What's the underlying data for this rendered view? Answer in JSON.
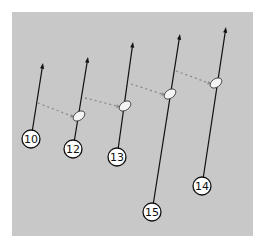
{
  "diagram": {
    "background": "#c8c8c8",
    "line_color": "#111111",
    "dash_color": "#8a8a8a",
    "nodes": [
      {
        "label": "10",
        "circle": [
          31,
          139
        ],
        "tip": [
          43,
          63
        ],
        "ellipse": null
      },
      {
        "label": "12",
        "circle": [
          73,
          149
        ],
        "tip": [
          88,
          57
        ],
        "ellipse": [
          79,
          116
        ]
      },
      {
        "label": "13",
        "circle": [
          117,
          157
        ],
        "tip": [
          133,
          42
        ],
        "ellipse": [
          125,
          106
        ]
      },
      {
        "label": "15",
        "circle": [
          152,
          212
        ],
        "tip": [
          180,
          34
        ],
        "ellipse": [
          170,
          94
        ]
      },
      {
        "label": "14",
        "circle": [
          202,
          186
        ],
        "tip": [
          226,
          27
        ],
        "ellipse": [
          216,
          83
        ]
      }
    ],
    "dashed_links": [
      {
        "from": [
          38,
          103
        ],
        "to": [
          74,
          117
        ]
      },
      {
        "from": [
          85,
          98
        ],
        "to": [
          120,
          107
        ]
      },
      {
        "from": [
          131,
          84
        ],
        "to": [
          165,
          95
        ]
      },
      {
        "from": [
          176,
          71
        ],
        "to": [
          211,
          84
        ]
      }
    ]
  },
  "caption": {
    "text": ""
  }
}
